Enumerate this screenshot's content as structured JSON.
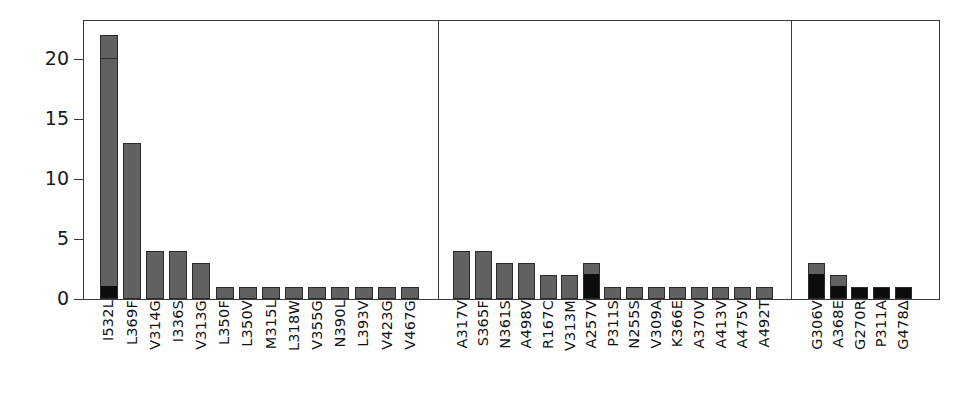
{
  "chart_data": {
    "type": "bar",
    "title": "",
    "xlabel": "",
    "ylabel": "",
    "ylim": [
      0,
      23.3
    ],
    "grid": false,
    "legend": null,
    "stacked": true,
    "y_ticks": [
      0,
      5,
      10,
      15,
      20
    ],
    "y_tick_labels": [
      "0",
      "5",
      "10",
      "15",
      "20"
    ],
    "series": [
      {
        "name": "black-segment",
        "color": "#0d0d0d"
      },
      {
        "name": "gray-segment",
        "color": "#616161"
      }
    ],
    "panels": [
      {
        "name": "panel-1",
        "categories": [
          "I532L",
          "L369F",
          "V314G",
          "I336S",
          "V313G",
          "L350F",
          "L350V",
          "M315L",
          "L318W",
          "V355G",
          "N390L",
          "L393V",
          "V423G",
          "V467G"
        ],
        "values": [
          22,
          13,
          4,
          4,
          3,
          1,
          1,
          1,
          1,
          1,
          1,
          1,
          1,
          1
        ],
        "stacks": [
          [
            {
              "color": "#0d0d0d",
              "value": 1
            },
            {
              "color": "#616161",
              "value": 19
            },
            {
              "color": "#616161",
              "value": 2
            }
          ],
          [
            {
              "color": "#616161",
              "value": 11
            },
            {
              "color": "#616161",
              "value": 2
            }
          ],
          [
            {
              "color": "#616161",
              "value": 4
            }
          ],
          [
            {
              "color": "#616161",
              "value": 4
            }
          ],
          [
            {
              "color": "#616161",
              "value": 3
            }
          ],
          [
            {
              "color": "#616161",
              "value": 1
            }
          ],
          [
            {
              "color": "#616161",
              "value": 1
            }
          ],
          [
            {
              "color": "#616161",
              "value": 1
            }
          ],
          [
            {
              "color": "#616161",
              "value": 1
            }
          ],
          [
            {
              "color": "#616161",
              "value": 1
            }
          ],
          [
            {
              "color": "#616161",
              "value": 1
            }
          ],
          [
            {
              "color": "#616161",
              "value": 1
            }
          ],
          [
            {
              "color": "#616161",
              "value": 1
            }
          ],
          [
            {
              "color": "#616161",
              "value": 1
            }
          ]
        ]
      },
      {
        "name": "panel-2",
        "categories": [
          "A317V",
          "S365F",
          "N361S",
          "A498V",
          "R167C",
          "V313M",
          "A257V",
          "P311S",
          "N255S",
          "V309A",
          "K366E",
          "A370V",
          "A413V",
          "A475V",
          "A492T"
        ],
        "values": [
          4,
          4,
          3,
          3,
          2,
          2,
          3,
          1,
          1,
          1,
          1,
          1,
          1,
          1,
          1
        ],
        "stacks": [
          [
            {
              "color": "#616161",
              "value": 4
            }
          ],
          [
            {
              "color": "#616161",
              "value": 1
            },
            {
              "color": "#616161",
              "value": 3
            }
          ],
          [
            {
              "color": "#616161",
              "value": 3
            }
          ],
          [
            {
              "color": "#616161",
              "value": 3
            }
          ],
          [
            {
              "color": "#616161",
              "value": 2
            }
          ],
          [
            {
              "color": "#616161",
              "value": 2
            }
          ],
          [
            {
              "color": "#0d0d0d",
              "value": 2
            },
            {
              "color": "#616161",
              "value": 1
            }
          ],
          [
            {
              "color": "#616161",
              "value": 1
            }
          ],
          [
            {
              "color": "#616161",
              "value": 1
            }
          ],
          [
            {
              "color": "#616161",
              "value": 1
            }
          ],
          [
            {
              "color": "#616161",
              "value": 1
            }
          ],
          [
            {
              "color": "#616161",
              "value": 1
            }
          ],
          [
            {
              "color": "#616161",
              "value": 1
            }
          ],
          [
            {
              "color": "#616161",
              "value": 1
            }
          ],
          [
            {
              "color": "#616161",
              "value": 1
            }
          ]
        ]
      },
      {
        "name": "panel-3",
        "categories": [
          "G306V",
          "A368E",
          "G270R",
          "P311A",
          "G478Δ"
        ],
        "values": [
          3,
          2,
          1,
          1,
          1
        ],
        "stacks": [
          [
            {
              "color": "#0d0d0d",
              "value": 2
            },
            {
              "color": "#616161",
              "value": 1
            }
          ],
          [
            {
              "color": "#0d0d0d",
              "value": 1
            },
            {
              "color": "#616161",
              "value": 1
            }
          ],
          [
            {
              "color": "#0d0d0d",
              "value": 1
            }
          ],
          [
            {
              "color": "#0d0d0d",
              "value": 1
            }
          ],
          [
            {
              "color": "#0d0d0d",
              "value": 1
            }
          ]
        ]
      }
    ]
  },
  "style": {
    "axis_color": "#3a3a3a",
    "bar_edge_color": "#2b2b2b",
    "gray_fill": "#616161",
    "black_fill": "#0d0d0d",
    "background": "#ffffff"
  }
}
